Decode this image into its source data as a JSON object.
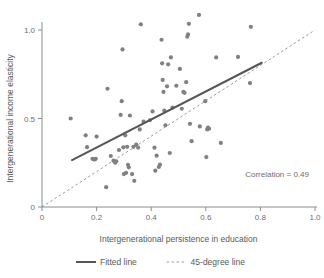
{
  "chart_data": {
    "type": "scatter",
    "title": "",
    "xlabel": "Intergenerational persistence in education",
    "ylabel": "Intergenerational income elasticity",
    "xlim": [
      0,
      1.0
    ],
    "ylim": [
      0,
      1.1
    ],
    "xticks": [
      0,
      0.2,
      0.4,
      0.6,
      0.8,
      1.0
    ],
    "xticklabels": [
      "0",
      "0.2",
      "0.4",
      "0.6",
      "0.8",
      "1.0"
    ],
    "yticks": [
      0,
      0.5,
      1.0
    ],
    "yticklabels": [
      "0",
      "0.5",
      "1.0"
    ],
    "grid": false,
    "annotation": "Correlation = 0.49",
    "legend_position": "below",
    "legend": [
      {
        "label": "Fitted line",
        "style": "solid",
        "color": "#55565a"
      },
      {
        "label": "45-degree line",
        "style": "dashed",
        "color": "#9a9b9e"
      }
    ],
    "series": [
      {
        "name": "countries",
        "marker": "circle",
        "color": "#7f8083",
        "points": [
          [
            0.105,
            0.5
          ],
          [
            0.16,
            0.405
          ],
          [
            0.165,
            0.338
          ],
          [
            0.185,
            0.272
          ],
          [
            0.192,
            0.268
          ],
          [
            0.197,
            0.272
          ],
          [
            0.2,
            0.398
          ],
          [
            0.235,
            0.112
          ],
          [
            0.24,
            0.668
          ],
          [
            0.252,
            0.288
          ],
          [
            0.262,
            0.262
          ],
          [
            0.268,
            0.25
          ],
          [
            0.272,
            0.258
          ],
          [
            0.282,
            0.322
          ],
          [
            0.288,
            0.52
          ],
          [
            0.292,
            0.598
          ],
          [
            0.295,
            0.89
          ],
          [
            0.298,
            0.337
          ],
          [
            0.3,
            0.186
          ],
          [
            0.305,
            0.405
          ],
          [
            0.308,
            0.193
          ],
          [
            0.312,
            0.34
          ],
          [
            0.315,
            0.238
          ],
          [
            0.318,
            0.224
          ],
          [
            0.322,
            0.517
          ],
          [
            0.33,
            0.186
          ],
          [
            0.335,
            0.34
          ],
          [
            0.338,
            0.148
          ],
          [
            0.345,
            0.352
          ],
          [
            0.352,
            0.336
          ],
          [
            0.358,
            0.438
          ],
          [
            0.362,
            1.032
          ],
          [
            0.372,
            0.482
          ],
          [
            0.395,
            0.49
          ],
          [
            0.405,
            0.54
          ],
          [
            0.412,
            0.335
          ],
          [
            0.415,
            0.205
          ],
          [
            0.42,
            0.29
          ],
          [
            0.428,
            0.226
          ],
          [
            0.432,
            0.239
          ],
          [
            0.438,
            0.945
          ],
          [
            0.44,
            0.812
          ],
          [
            0.442,
            0.718
          ],
          [
            0.445,
            0.65
          ],
          [
            0.448,
            0.545
          ],
          [
            0.452,
            0.462
          ],
          [
            0.458,
            0.682
          ],
          [
            0.462,
            0.806
          ],
          [
            0.468,
            0.305
          ],
          [
            0.472,
            0.845
          ],
          [
            0.478,
            0.562
          ],
          [
            0.492,
            0.685
          ],
          [
            0.505,
            0.78
          ],
          [
            0.512,
            0.555
          ],
          [
            0.518,
            0.65
          ],
          [
            0.522,
            0.645
          ],
          [
            0.528,
            0.705
          ],
          [
            0.532,
            0.962
          ],
          [
            0.535,
            0.975
          ],
          [
            0.538,
            1.035
          ],
          [
            0.542,
            0.47
          ],
          [
            0.548,
            0.372
          ],
          [
            0.575,
            1.085
          ],
          [
            0.578,
            0.455
          ],
          [
            0.598,
            0.598
          ],
          [
            0.602,
            0.282
          ],
          [
            0.605,
            0.438
          ],
          [
            0.608,
            0.448
          ],
          [
            0.612,
            0.442
          ],
          [
            0.638,
            0.845
          ],
          [
            0.655,
            0.362
          ],
          [
            0.718,
            0.848
          ],
          [
            0.762,
            0.7
          ],
          [
            0.765,
            1.018
          ]
        ]
      }
    ],
    "fitted_line": {
      "x0": 0.11,
      "y0": 0.265,
      "x1": 0.805,
      "y1": 0.815
    },
    "reference_line": {
      "x0": 0.0,
      "y0": 0.0,
      "x1": 1.0,
      "y1": 1.0
    }
  }
}
